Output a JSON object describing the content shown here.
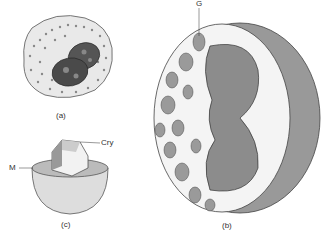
{
  "figure": {
    "panels": [
      {
        "id": "a",
        "label": "(a)",
        "description": "cell with bilobed nucleus and dense granules"
      },
      {
        "id": "b",
        "label": "(b)",
        "description": "cutaway 3D cell with granules, large nucleus, surface projections"
      },
      {
        "id": "c",
        "label": "(c)",
        "description": "single granule: hemispherical membrane with crystalloid core"
      }
    ],
    "callouts": [
      {
        "id": "G",
        "text": "G",
        "panel": "b"
      },
      {
        "id": "Cry",
        "text": "Cry",
        "panel": "c"
      },
      {
        "id": "M",
        "text": "M",
        "panel": "c"
      }
    ],
    "colors": {
      "ink": "#333333",
      "fill_light": "#f2f2f2",
      "fill_mid": "#9a9a9a",
      "fill_dark": "#555555"
    }
  }
}
